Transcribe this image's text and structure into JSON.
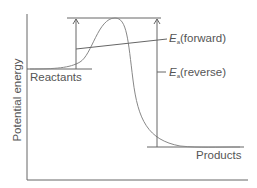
{
  "diagram": {
    "y_axis_label": "Potential energy",
    "labels": {
      "reactants": "Reactants",
      "products": "Products",
      "ea_symbol": "E",
      "ea_subscript": "a",
      "forward": "(forward)",
      "reverse": "(reverse)"
    },
    "colors": {
      "axis": "#666666",
      "curve": "#888888",
      "text": "#555555"
    }
  }
}
